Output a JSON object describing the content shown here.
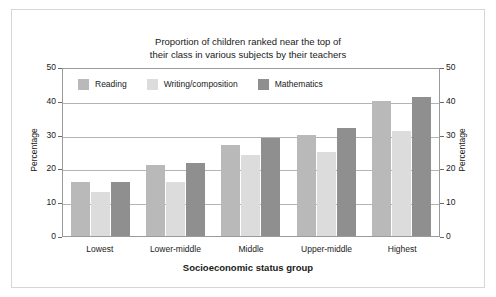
{
  "chart_data": {
    "type": "bar",
    "title": "Proportion of children ranked near the top of\ntheir class in various subjects by their teachers",
    "xlabel": "Socioeconomic status group",
    "ylabel": "Percentage",
    "ylabel_right": "Percentage",
    "categories": [
      "Lowest",
      "Lower-middle",
      "Middle",
      "Upper-middle",
      "Highest"
    ],
    "series": [
      {
        "name": "Reading",
        "values": [
          16,
          21,
          27,
          30,
          40
        ],
        "color": "#b9b9b9"
      },
      {
        "name": "Writing/composition",
        "values": [
          13,
          16,
          24,
          25,
          31
        ],
        "color": "#dcdcdc"
      },
      {
        "name": "Mathematics",
        "values": [
          16,
          21.5,
          29,
          32,
          41
        ],
        "color": "#8f8f8f"
      }
    ],
    "ylim": [
      0,
      50
    ],
    "yticks": [
      0,
      10,
      20,
      30,
      40,
      50
    ],
    "grid": true,
    "legend_position": "top-inside"
  }
}
